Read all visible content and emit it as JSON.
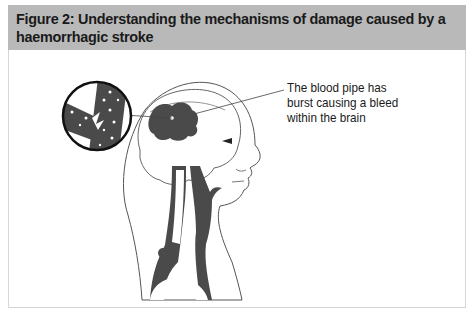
{
  "figure": {
    "title": "Figure 2: Understanding the mechanisms of damage caused by a haemorrhagic stroke",
    "callout_label": "The blood pipe has burst causing a bleed within the brain",
    "illustration": "side-profile head with brain, ruptured vessel magnified inset, and neck arteries",
    "colors": {
      "header_bg": "#b9b9b9",
      "blood_fill": "#4a4a4a",
      "outline": "#333333",
      "border": "#d6d6d6"
    }
  }
}
